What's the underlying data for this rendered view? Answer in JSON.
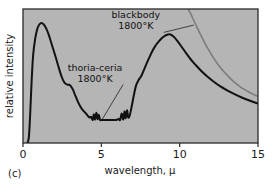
{
  "panel": {
    "label": "(c)"
  },
  "chart_data": {
    "type": "line",
    "title": "",
    "subtitle": "",
    "xlabel": "wavelength, μ",
    "ylabel": "relative intensity",
    "xlim": [
      0,
      15
    ],
    "ylim": [
      0,
      1.0
    ],
    "xticks": [
      0,
      5,
      10,
      15
    ],
    "xtick_labels": [
      "0",
      "5",
      "10",
      "15"
    ],
    "yticks": [],
    "ytick_labels": [],
    "grid": false,
    "legend": "none",
    "plot_background_color": "#b5b5b5",
    "frame_color": "#2a2a2a",
    "annotations": [
      {
        "name": "blackbody-annotation",
        "line1": "blackbody",
        "line2": "1800°K",
        "x": 7.2,
        "y": 0.93,
        "leader_to_x": 10.9,
        "leader_to_y": 0.88
      },
      {
        "name": "thoria-ceria-annotation",
        "line1": "thoria-ceria",
        "line2": "1800°K",
        "x": 4.6,
        "y": 0.54,
        "leader_to_x": 5.05,
        "leader_to_y": 0.175
      }
    ],
    "series": [
      {
        "name": "thoria-ceria 1800°K",
        "color": "#111111",
        "width": 2.0,
        "x": [
          0.3,
          0.38,
          0.46,
          0.55,
          0.65,
          0.78,
          0.92,
          1.05,
          1.18,
          1.32,
          1.48,
          1.65,
          1.85,
          2.05,
          2.25,
          2.45,
          2.62,
          2.75,
          2.85,
          2.95,
          3.05,
          3.18,
          3.32,
          3.48,
          3.65,
          3.82,
          3.98,
          4.12,
          4.25,
          4.35,
          4.45,
          4.52,
          4.6,
          4.68,
          4.76,
          4.84,
          4.92,
          5.0,
          5.2,
          5.45,
          5.7,
          5.95,
          6.1,
          6.2,
          6.3,
          6.4,
          6.48,
          6.56,
          6.64,
          6.72,
          6.82,
          6.95,
          7.08,
          7.22,
          7.38,
          7.55,
          7.72,
          7.88,
          8.05,
          8.25,
          8.45,
          8.65,
          8.85,
          9.05,
          9.25,
          9.45,
          9.65,
          9.85,
          10.1,
          10.4,
          10.7,
          11.0,
          11.4,
          11.8,
          12.2,
          12.6,
          13.0,
          13.5,
          14.0,
          14.5,
          15.0
        ],
        "y": [
          0.005,
          0.05,
          0.22,
          0.46,
          0.66,
          0.78,
          0.855,
          0.885,
          0.895,
          0.885,
          0.855,
          0.805,
          0.73,
          0.655,
          0.575,
          0.5,
          0.455,
          0.44,
          0.435,
          0.435,
          0.425,
          0.4,
          0.36,
          0.315,
          0.275,
          0.245,
          0.225,
          0.205,
          0.19,
          0.195,
          0.172,
          0.215,
          0.175,
          0.225,
          0.178,
          0.21,
          0.172,
          0.172,
          0.172,
          0.172,
          0.172,
          0.172,
          0.18,
          0.172,
          0.22,
          0.175,
          0.235,
          0.185,
          0.245,
          0.19,
          0.21,
          0.28,
          0.36,
          0.43,
          0.47,
          0.5,
          0.545,
          0.59,
          0.635,
          0.685,
          0.725,
          0.755,
          0.782,
          0.8,
          0.81,
          0.808,
          0.79,
          0.762,
          0.722,
          0.672,
          0.625,
          0.585,
          0.535,
          0.492,
          0.455,
          0.422,
          0.395,
          0.365,
          0.338,
          0.315,
          0.295
        ]
      },
      {
        "name": "blackbody 1800°K",
        "color": "#7c7c7c",
        "width": 1.6,
        "x": [
          10.55,
          10.7,
          10.9,
          11.1,
          11.35,
          11.6,
          11.9,
          12.2,
          12.5,
          12.8,
          13.1,
          13.45,
          13.8,
          14.15,
          14.5,
          14.8,
          15.0
        ],
        "y": [
          1.0,
          0.965,
          0.915,
          0.865,
          0.805,
          0.748,
          0.685,
          0.628,
          0.578,
          0.535,
          0.497,
          0.458,
          0.425,
          0.398,
          0.375,
          0.358,
          0.348
        ]
      }
    ]
  }
}
